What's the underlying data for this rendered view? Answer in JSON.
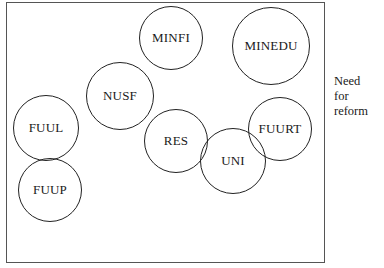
{
  "diagram": {
    "side_label": {
      "line1": "Need",
      "line2": "for reform"
    },
    "nodes": [
      {
        "id": "minfi",
        "label": "MINFI",
        "cx": 171,
        "cy": 38,
        "r": 32
      },
      {
        "id": "minedu",
        "label": "MINEDU",
        "cx": 271,
        "cy": 46,
        "r": 39
      },
      {
        "id": "nusf",
        "label": "NUSF",
        "cx": 120,
        "cy": 96,
        "r": 34
      },
      {
        "id": "fuul",
        "label": "FUUL",
        "cx": 46,
        "cy": 128,
        "r": 33
      },
      {
        "id": "res",
        "label": "RES",
        "cx": 176,
        "cy": 141,
        "r": 32
      },
      {
        "id": "fuurt",
        "label": "FUURT",
        "cx": 280,
        "cy": 129,
        "r": 32
      },
      {
        "id": "uni",
        "label": "UNI",
        "cx": 233,
        "cy": 161,
        "r": 33
      },
      {
        "id": "fuup",
        "label": "FUUP",
        "cx": 50,
        "cy": 190,
        "r": 32
      }
    ]
  }
}
